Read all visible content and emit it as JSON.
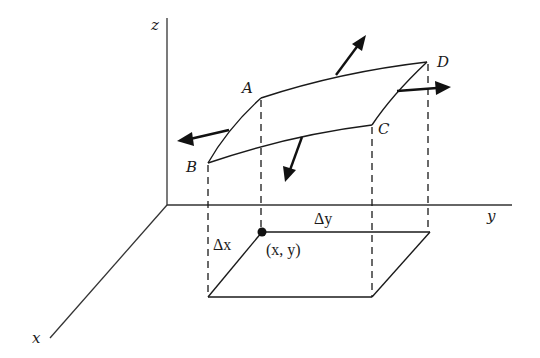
{
  "diagram": {
    "axes": {
      "x_label": "x",
      "y_label": "y",
      "z_label": "z"
    },
    "surface_corners": {
      "A": "A",
      "B": "B",
      "C": "C",
      "D": "D"
    },
    "base": {
      "point_label": "(x, y)",
      "delta_x": "Δx",
      "delta_y": "Δy"
    },
    "normals": [
      {
        "name": "up-normal",
        "direction": "upward-right"
      },
      {
        "name": "right-normal",
        "direction": "positive-y"
      },
      {
        "name": "left-normal",
        "direction": "negative-y"
      },
      {
        "name": "down-normal",
        "direction": "downward"
      }
    ],
    "colors": {
      "line": "#1a1a1a",
      "background": "#ffffff"
    }
  }
}
